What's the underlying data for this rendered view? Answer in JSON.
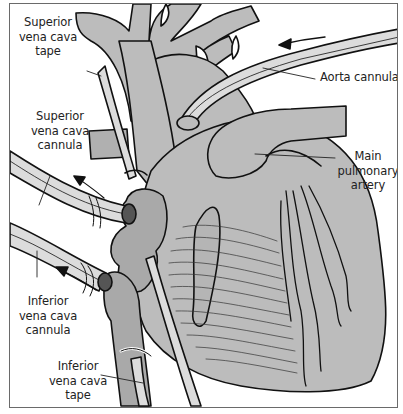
{
  "diagram": {
    "labels": {
      "svc_tape": "Superior\nvena cava\ntape",
      "svc_cannula": "Superior\nvena cava\ncannula",
      "ivc_cannula": "Inferior\nvena cava\ncannula",
      "ivc_tape": "Inferior\nvena cava\ntape",
      "aorta_cannula": "Aorta cannula",
      "main_pulmonary_artery": "Main\npulmonary\nartery"
    },
    "flow_arrows": [
      {
        "name": "aorta-inflow",
        "direction": "left"
      },
      {
        "name": "svc-outflow",
        "direction": "up-left"
      },
      {
        "name": "ivc-outflow",
        "direction": "up-left"
      }
    ],
    "colors": {
      "tissue": "#bcbcbc",
      "tissue_dark": "#a9a9a9",
      "tube": "#dcdcdc",
      "outline": "#111111",
      "background": "#ffffff",
      "frame": "#6a6a6a"
    }
  }
}
